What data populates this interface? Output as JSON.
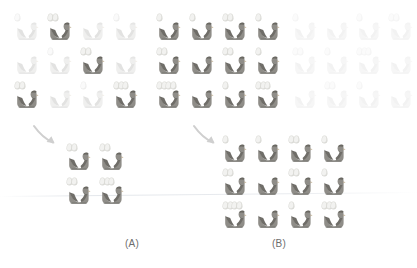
{
  "figure": {
    "type": "diagram",
    "background_color": "#ffffff"
  },
  "palette": {
    "hen_dark_body": "#8f8d88",
    "hen_dark_shade": "#6f6d68",
    "hen_dark_comb": "#6a6862",
    "hen_light_body": "#efefee",
    "hen_light_shade": "#e2e2e1",
    "hen_ghost_body": "#f6f6f6",
    "egg_dark": "#f2f2f0",
    "egg_light": "#fafafa",
    "egg_outline_dark": "#d8d8d4",
    "egg_outline_light": "#ededec",
    "arrow_color": "#cfcfcf",
    "label_color": "#6d6d6d"
  },
  "panels": [
    {
      "id": "A",
      "label": "(A)",
      "label_x": 125,
      "label_y": 238,
      "source_grid": {
        "name": "panel-a-source-grid",
        "rows": 3,
        "cols": 4,
        "origin_x": 14,
        "origin_y": 12,
        "step_x": 33,
        "step_y": 34,
        "cells": [
          {
            "eggs": 1,
            "tone": "light"
          },
          {
            "eggs": 2,
            "tone": "dark"
          },
          {
            "eggs": 0,
            "tone": "light"
          },
          {
            "eggs": 1,
            "tone": "light"
          },
          {
            "eggs": 0,
            "tone": "light"
          },
          {
            "eggs": 1,
            "tone": "light"
          },
          {
            "eggs": 2,
            "tone": "dark"
          },
          {
            "eggs": 0,
            "tone": "light"
          },
          {
            "eggs": 2,
            "tone": "dark"
          },
          {
            "eggs": 0,
            "tone": "light"
          },
          {
            "eggs": 1,
            "tone": "light"
          },
          {
            "eggs": 3,
            "tone": "dark"
          }
        ]
      },
      "arrow": {
        "name": "panel-a-arrow",
        "x": 32,
        "y": 124,
        "width": 28,
        "height": 24
      },
      "result_grid": {
        "name": "panel-a-result-grid",
        "rows": 2,
        "cols": 2,
        "origin_x": 66,
        "origin_y": 142,
        "step_x": 33,
        "step_y": 34,
        "cells": [
          {
            "eggs": 2,
            "tone": "dark"
          },
          {
            "eggs": 2,
            "tone": "dark"
          },
          {
            "eggs": 2,
            "tone": "dark"
          },
          {
            "eggs": 3,
            "tone": "dark"
          }
        ]
      }
    },
    {
      "id": "B",
      "label": "(B)",
      "label_x": 272,
      "label_y": 238,
      "source_grid": {
        "name": "panel-b-source-grid",
        "rows": 3,
        "cols": 4,
        "origin_x": 156,
        "origin_y": 12,
        "step_x": 33,
        "step_y": 34,
        "cells": [
          {
            "eggs": 1,
            "tone": "dark"
          },
          {
            "eggs": 1,
            "tone": "dark"
          },
          {
            "eggs": 2,
            "tone": "dark"
          },
          {
            "eggs": 1,
            "tone": "dark"
          },
          {
            "eggs": 2,
            "tone": "dark"
          },
          {
            "eggs": 0,
            "tone": "dark"
          },
          {
            "eggs": 2,
            "tone": "dark"
          },
          {
            "eggs": 1,
            "tone": "dark"
          },
          {
            "eggs": 4,
            "tone": "dark"
          },
          {
            "eggs": 0,
            "tone": "dark"
          },
          {
            "eggs": 1,
            "tone": "dark"
          },
          {
            "eggs": 3,
            "tone": "dark"
          }
        ]
      },
      "arrow": {
        "name": "panel-b-arrow",
        "x": 192,
        "y": 124,
        "width": 28,
        "height": 24
      },
      "result_grid": {
        "name": "panel-b-result-grid",
        "rows": 3,
        "cols": 4,
        "origin_x": 222,
        "origin_y": 134,
        "step_x": 33,
        "step_y": 33,
        "cells": [
          {
            "eggs": 1,
            "tone": "dark"
          },
          {
            "eggs": 1,
            "tone": "dark"
          },
          {
            "eggs": 2,
            "tone": "dark"
          },
          {
            "eggs": 1,
            "tone": "dark"
          },
          {
            "eggs": 2,
            "tone": "dark"
          },
          {
            "eggs": 0,
            "tone": "dark"
          },
          {
            "eggs": 2,
            "tone": "dark"
          },
          {
            "eggs": 1,
            "tone": "dark"
          },
          {
            "eggs": 4,
            "tone": "dark"
          },
          {
            "eggs": 0,
            "tone": "dark"
          },
          {
            "eggs": 1,
            "tone": "dark"
          },
          {
            "eggs": 3,
            "tone": "dark"
          }
        ]
      }
    }
  ],
  "ghost_grid": {
    "name": "background-ghost-grid",
    "rows": 3,
    "cols": 4,
    "origin_x": 292,
    "origin_y": 12,
    "step_x": 32,
    "step_y": 34,
    "cells": [
      {
        "eggs": 1,
        "tone": "ghost"
      },
      {
        "eggs": 0,
        "tone": "ghost"
      },
      {
        "eggs": 1,
        "tone": "ghost"
      },
      {
        "eggs": 2,
        "tone": "ghost"
      },
      {
        "eggs": 2,
        "tone": "ghost"
      },
      {
        "eggs": 1,
        "tone": "ghost"
      },
      {
        "eggs": 3,
        "tone": "ghost"
      },
      {
        "eggs": 0,
        "tone": "ghost"
      },
      {
        "eggs": 0,
        "tone": "ghost"
      },
      {
        "eggs": 2,
        "tone": "ghost"
      },
      {
        "eggs": 1,
        "tone": "ghost"
      },
      {
        "eggs": 0,
        "tone": "ghost"
      }
    ]
  }
}
